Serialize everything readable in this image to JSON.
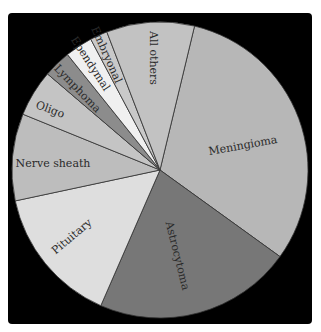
{
  "chart_data": {
    "type": "pie",
    "title": "",
    "start_angle_deg": 13.5,
    "direction": "clockwise",
    "categories": [
      "Meningioma",
      "Astrocytoma",
      "Pituitary",
      "Nerve sheath",
      "Oligo",
      "Lymphoma",
      "Ependymal",
      "Embryonal",
      "All others"
    ],
    "values": [
      31.2,
      21.6,
      15.1,
      9.5,
      5.1,
      3.0,
      3.0,
      1.9,
      9.6
    ],
    "unit": "percent (estimated from slice angles)",
    "colors": [
      "#b7b7b7",
      "#777777",
      "#dedede",
      "#bdbdbd",
      "#c4c4c4",
      "#8c8c8c",
      "#f0f0f0",
      "#c9c9c9",
      "#c2c2c2"
    ],
    "legend": "none (labels placed inside slices)",
    "background": "#000000",
    "edge_color": "#333333"
  },
  "labels": [
    {
      "text": "Meningioma",
      "x": 243,
      "y": 146,
      "rotate": -10
    },
    {
      "text": "Astrocytoma",
      "x": 177,
      "y": 256,
      "rotate": 76
    },
    {
      "text": "Pituitary",
      "x": 72,
      "y": 237,
      "rotate": -40
    },
    {
      "text": "Nerve sheath",
      "x": 53,
      "y": 164,
      "rotate": 0
    },
    {
      "text": "Oligo",
      "x": 50,
      "y": 110,
      "rotate": 20
    },
    {
      "text": "Lymphoma",
      "x": 77,
      "y": 89,
      "rotate": 46
    },
    {
      "text": "Ependymal",
      "x": 90,
      "y": 64,
      "rotate": 57
    },
    {
      "text": "Embryonal",
      "x": 106,
      "y": 55,
      "rotate": 66
    },
    {
      "text": "All others",
      "x": 153,
      "y": 58,
      "rotate": 90
    }
  ]
}
